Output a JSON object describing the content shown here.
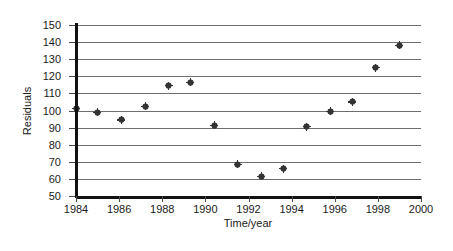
{
  "chart_data": {
    "type": "scatter",
    "title": "",
    "xlabel": "Time/year",
    "ylabel": "Residuals",
    "xlim": [
      1984,
      2000
    ],
    "ylim": [
      50,
      150
    ],
    "xticks": [
      1984,
      1986,
      1988,
      1990,
      1992,
      1994,
      1996,
      1998,
      2000
    ],
    "yticks": [
      50,
      60,
      70,
      80,
      90,
      100,
      110,
      120,
      130,
      140,
      150
    ],
    "grid": "horizontal",
    "legend": "none",
    "marker": "diamond-plus",
    "marker_color": "#333333",
    "points": [
      {
        "x": 1984.0,
        "y": 101.0
      },
      {
        "x": 1985.0,
        "y": 99.0
      },
      {
        "x": 1986.1,
        "y": 94.5
      },
      {
        "x": 1987.2,
        "y": 102.5
      },
      {
        "x": 1988.3,
        "y": 114.5
      },
      {
        "x": 1989.3,
        "y": 116.5
      },
      {
        "x": 1990.4,
        "y": 91.5
      },
      {
        "x": 1991.5,
        "y": 68.5
      },
      {
        "x": 1992.6,
        "y": 61.5
      },
      {
        "x": 1993.6,
        "y": 66.0
      },
      {
        "x": 1994.7,
        "y": 90.5
      },
      {
        "x": 1995.8,
        "y": 99.5
      },
      {
        "x": 1996.8,
        "y": 105.0
      },
      {
        "x": 1997.9,
        "y": 125.0
      },
      {
        "x": 1999.0,
        "y": 138.0
      }
    ]
  },
  "colors": {
    "gridline": "#6e6e6e",
    "axis": "#111111",
    "marker": "#333333",
    "frame": "#2b2b2b",
    "background": "#ffffff"
  }
}
